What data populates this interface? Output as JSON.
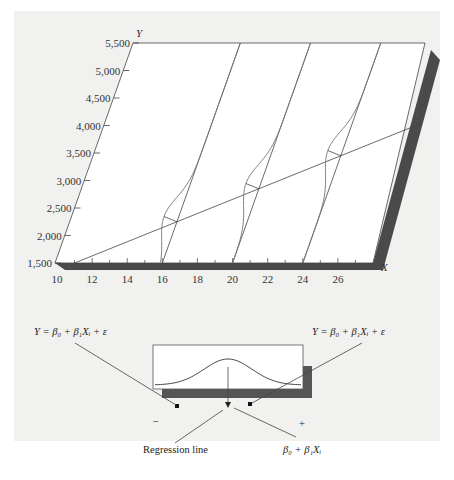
{
  "figure": {
    "y_axis": {
      "label": "Y",
      "ticks": [
        "1,500",
        "2,000",
        "2,500",
        "3,000",
        "3,500",
        "4,000",
        "4,500",
        "5,000",
        "5,500"
      ],
      "range": [
        1500,
        5500
      ]
    },
    "x_axis": {
      "label": "X",
      "ticks": [
        "10",
        "12",
        "14",
        "16",
        "18",
        "20",
        "22",
        "24",
        "26"
      ],
      "range": [
        10,
        28
      ]
    },
    "regression_line": {
      "x_start": 11,
      "x_end": 28,
      "y_start": 1500,
      "y_end": 4050
    },
    "distributions_at_x": [
      16,
      20,
      24
    ],
    "inset": {
      "title": "Probability distribution",
      "minus_label": "−",
      "plus_label": "+",
      "left_equation": "Y = β₀ + β₁Xᵢ + ε",
      "right_equation": "Y = β₀ + β₁Xᵢ + ε",
      "regression_line_label": "Regression line",
      "mean_label": "β₀ + β₁Xᵢ"
    }
  }
}
